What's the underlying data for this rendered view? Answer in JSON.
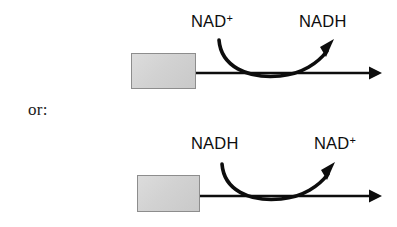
{
  "diagram": {
    "background_color": "#ffffff",
    "stroke_color": "#0d0d0d",
    "box_fill_color": "#d5d5d5",
    "box_border_color": "#8d8d8d",
    "connector": {
      "label": "or:"
    },
    "reactions": [
      {
        "id": "oxidation",
        "substrate_box_label": "",
        "cofactor_in": "NAD",
        "cofactor_in_charge": "+",
        "cofactor_out": "NADH",
        "cofactor_out_charge": "",
        "main_arrow_direction": "right",
        "curved_arrow_direction": "in-to-out"
      },
      {
        "id": "reduction",
        "substrate_box_label": "",
        "cofactor_in": "NADH",
        "cofactor_in_charge": "",
        "cofactor_out": "NAD",
        "cofactor_out_charge": "+",
        "main_arrow_direction": "right",
        "curved_arrow_direction": "in-to-out"
      }
    ]
  }
}
